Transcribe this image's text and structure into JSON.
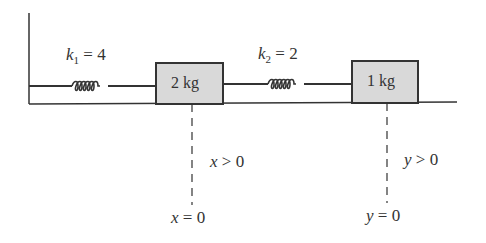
{
  "diagram": {
    "springs": [
      {
        "name": "k1",
        "symbol": "k",
        "subscript": "1",
        "value": "4",
        "label": "k1 = 4"
      },
      {
        "name": "k2",
        "symbol": "k",
        "subscript": "2",
        "value": "2",
        "label": "k2 = 2"
      }
    ],
    "masses": [
      {
        "name": "m1",
        "label": "2 kg"
      },
      {
        "name": "m2",
        "label": "1 kg"
      }
    ],
    "displacements": [
      {
        "var": "x",
        "positive": "> 0",
        "zero": "= 0"
      },
      {
        "var": "y",
        "positive": "> 0",
        "zero": "= 0"
      }
    ],
    "colors": {
      "line": "#333333",
      "mass_fill": "#d9d9d9",
      "text": "#333333"
    }
  }
}
